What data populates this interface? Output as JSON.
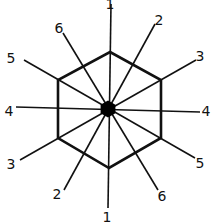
{
  "diagram": {
    "type": "hexagon-radial-axes",
    "center": {
      "x": 108,
      "y": 109
    },
    "hexagon_vertices": [
      [
        110,
        52
      ],
      [
        161,
        80
      ],
      [
        161,
        138
      ],
      [
        109,
        168
      ],
      [
        58,
        138
      ],
      [
        58,
        80
      ]
    ],
    "lines": [
      {
        "id": "1",
        "x1": 111,
        "y1": 4,
        "x2": 108,
        "y2": 208
      },
      {
        "id": "2",
        "x1": 155,
        "y1": 24,
        "x2": 64,
        "y2": 190
      },
      {
        "id": "3",
        "x1": 196,
        "y1": 60,
        "x2": 20,
        "y2": 160
      },
      {
        "id": "4",
        "x1": 200,
        "y1": 112,
        "x2": 16,
        "y2": 107
      },
      {
        "id": "5",
        "x1": 195,
        "y1": 158,
        "x2": 24,
        "y2": 60
      },
      {
        "id": "6",
        "x1": 158,
        "y1": 190,
        "x2": 63,
        "y2": 33
      }
    ],
    "labels": [
      {
        "text": "1",
        "x": 110,
        "y": 9
      },
      {
        "text": "2",
        "x": 159,
        "y": 25
      },
      {
        "text": "3",
        "x": 200,
        "y": 61
      },
      {
        "text": "4",
        "x": 206,
        "y": 116
      },
      {
        "text": "5",
        "x": 200,
        "y": 168
      },
      {
        "text": "6",
        "x": 162,
        "y": 201
      },
      {
        "text": "1",
        "x": 107,
        "y": 222
      },
      {
        "text": "2",
        "x": 57,
        "y": 199
      },
      {
        "text": "3",
        "x": 11,
        "y": 169
      },
      {
        "text": "4",
        "x": 9,
        "y": 116
      },
      {
        "text": "5",
        "x": 11,
        "y": 63
      },
      {
        "text": "6",
        "x": 59,
        "y": 33
      }
    ],
    "stroke_color": "#111111",
    "center_marker": "filled-hexagon"
  }
}
